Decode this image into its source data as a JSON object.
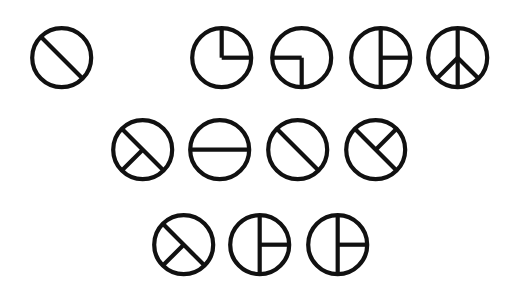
{
  "canvas": {
    "width": 514,
    "height": 290,
    "background": "#ffffff"
  },
  "style": {
    "stroke": "#111111",
    "stroke_width": 4.2,
    "radius": 29.5
  },
  "glyphs": [
    {
      "id": "g1",
      "row": 1,
      "cx": 62,
      "cy": 58,
      "name": "diagonal-circle-icon",
      "chords": [
        [
          225,
          45
        ]
      ],
      "rays": []
    },
    {
      "id": "g2",
      "row": 1,
      "cx": 222,
      "cy": 58,
      "name": "quarter-top-right-icon",
      "chords": [],
      "rays": [
        270,
        0
      ]
    },
    {
      "id": "g3",
      "row": 1,
      "cx": 302,
      "cy": 58,
      "name": "quarter-left-bottom-icon",
      "chords": [],
      "rays": [
        180,
        90
      ]
    },
    {
      "id": "g4",
      "row": 1,
      "cx": 381,
      "cy": 58,
      "name": "vertical-right-ray-icon",
      "chords": [
        [
          270,
          90
        ]
      ],
      "rays": [
        0
      ]
    },
    {
      "id": "g5",
      "row": 1,
      "cx": 458,
      "cy": 58,
      "name": "peace-sign-icon",
      "chords": [
        [
          270,
          90
        ]
      ],
      "rays": [
        135,
        45
      ]
    },
    {
      "id": "g6",
      "row": 2,
      "cx": 143,
      "cy": 150,
      "name": "diagonal-sw-ray-icon",
      "chords": [
        [
          225,
          45
        ]
      ],
      "rays": [
        135
      ]
    },
    {
      "id": "g7",
      "row": 2,
      "cx": 220,
      "cy": 150,
      "name": "horizontal-circle-icon",
      "chords": [
        [
          180,
          0
        ]
      ],
      "rays": []
    },
    {
      "id": "g8",
      "row": 2,
      "cx": 298,
      "cy": 150,
      "name": "diagonal-circle-icon",
      "chords": [
        [
          225,
          45
        ]
      ],
      "rays": []
    },
    {
      "id": "g9",
      "row": 2,
      "cx": 376,
      "cy": 150,
      "name": "diagonal-ne-ray-icon",
      "chords": [
        [
          225,
          45
        ]
      ],
      "rays": [
        315
      ]
    },
    {
      "id": "g10",
      "row": 3,
      "cx": 184,
      "cy": 245,
      "name": "diagonal-sw-ray-icon",
      "chords": [
        [
          225,
          45
        ]
      ],
      "rays": [
        135
      ]
    },
    {
      "id": "g11",
      "row": 3,
      "cx": 260,
      "cy": 245,
      "name": "vertical-right-ray-icon",
      "chords": [
        [
          270,
          90
        ]
      ],
      "rays": [
        0
      ]
    },
    {
      "id": "g12",
      "row": 3,
      "cx": 338,
      "cy": 245,
      "name": "vertical-right-ray-icon",
      "chords": [
        [
          270,
          90
        ]
      ],
      "rays": [
        0
      ]
    }
  ]
}
